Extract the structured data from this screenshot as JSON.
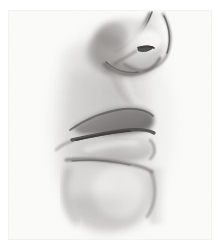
{
  "artwork": {
    "title": "Profile study of nose, lips and chin",
    "medium": "graphite pencil on paper",
    "subject": "human face in profile",
    "orientation": "facing right",
    "caption": "",
    "colors": {
      "page_background": "#ffffff",
      "paper": "#fbfbfa",
      "paper_edge": "#f2f2f0",
      "lightest_highlight": "#fdfdfc",
      "mid_tone": "#b9b7b4",
      "shadow": "#8d8a87",
      "deep_shadow": "#63605e",
      "darkest_accent": "#3c3a38"
    },
    "regions": [
      {
        "name": "nose-bridge",
        "label": "Nose bridge",
        "tone": "mid"
      },
      {
        "name": "nose-tip",
        "label": "Nose tip",
        "tone": "highlight"
      },
      {
        "name": "nostril",
        "label": "Nostril",
        "tone": "darkest"
      },
      {
        "name": "nose-wing",
        "label": "Nose wing",
        "tone": "shadow"
      },
      {
        "name": "philtrum",
        "label": "Philtrum",
        "tone": "light"
      },
      {
        "name": "upper-lip",
        "label": "Upper lip",
        "tone": "shadow"
      },
      {
        "name": "mouth-line",
        "label": "Mouth line",
        "tone": "darkest"
      },
      {
        "name": "lower-lip",
        "label": "Lower lip",
        "tone": "light"
      },
      {
        "name": "chin-crease",
        "label": "Chin crease",
        "tone": "shadow"
      },
      {
        "name": "chin",
        "label": "Chin",
        "tone": "light"
      },
      {
        "name": "cheek-shading",
        "label": "Cheek shading",
        "tone": "mid"
      },
      {
        "name": "jaw-contour",
        "label": "Jaw contour",
        "tone": "mid"
      }
    ]
  }
}
